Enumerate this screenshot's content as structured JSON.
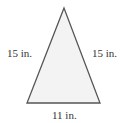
{
  "diagram": {
    "shape": "isosceles-triangle",
    "fill_color": "#f3f3f3",
    "stroke_color": "#555555",
    "sides": {
      "left": "15 in.",
      "right": "15 in.",
      "base": "11 in."
    }
  }
}
